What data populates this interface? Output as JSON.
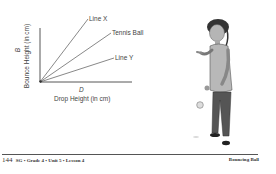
{
  "graph": {
    "y_axis_variable": "B",
    "y_axis_label": "Bounce Height (in cm)",
    "x_axis_variable": "D",
    "x_axis_label": "Drop Height (in cm)",
    "lines": [
      {
        "label": "Line X"
      },
      {
        "label": "Tennis Ball"
      },
      {
        "label": "Line Y"
      }
    ]
  },
  "illustration": {
    "description": "student-dropping-ball"
  },
  "footer": {
    "page_number": "144",
    "left_text": "SG • Grade 4 • Unit 5 • Lesson 4",
    "right_text": "Bouncing Ball"
  }
}
